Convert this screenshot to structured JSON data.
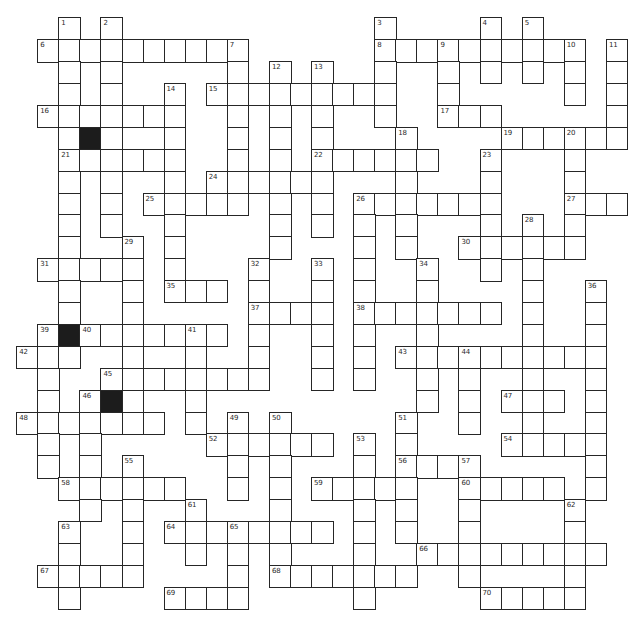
{
  "puzzle": {
    "type": "crossword",
    "columns": 29,
    "rows_count": 27,
    "legend": {
      "W": "white-cell",
      "#": "black-cell",
      ".": "empty"
    },
    "colors": {
      "line": "#262626",
      "black_cell": "#1c1c1c",
      "background": "#ffffff"
    }
  },
  "grid": {
    "rows": [
      "..W.W............W....W.W....",
      ".WWWWWWWWWW......WWWWWWWWWW.W",
      "..W.W.....W.W.W..W..W.W.W.W.W",
      "..W.W..W.WWWWWWWWW..W.....W.W",
      ".WWWWWWW..W.W.W..W..WWW.....W",
      "..W#W..W..W.W.W...W....WWWWWW",
      "..WWWWWW..W.W.WWWWWW..W...W..",
      "..W.W..W.WWWWWW...W...W...W..",
      "..W.W.WWWWW.W.W.WWWWWWW...WWW",
      "..W.W..W....W.W.W.W...W.W.W..",
      "..W..W.W....W...W.W..WWWWWW..",
      ".WWWWW.W...W..W.W..W..W.W....",
      "..W..W.WWW.W..W.W..W....W..W.",
      "..W..W.....WWWW.WWWWWWW.W..W.",
      ".W#WWWWWWW.W..W.W..W....W..W.",
      "WWW..W..W..W..W.W.WWWWWWWWWW.",
      ".W..WWWWWWWW..W.W..W.W..W..W.",
      ".W.W#W..W..........W.W.WWW.W.",
      "WWWWWWW.W.W.W.....W..W..W..W.",
      ".W.W.....WWWWWW.W.W....WWWWW.",
      ".W.W.W....W.W...W.WWWW.....W.",
      "..WWWWWW..W.W.WWWWW..WWWWW.W.",
      "...W.W..W...W...W.W..W....W..",
      "..W..W.WWWWWWWW.W.W..W....W..",
      "..W..W..W.W.W...W..WWWWWWWWW.",
      ".WWWWW....W.WWWWWWW..W....W..",
      "..W....WWWW.....W.....WWWWW.."
    ],
    "numbers": [
      {
        "n": "1",
        "c": 2,
        "r": 0
      },
      {
        "n": "2",
        "c": 4,
        "r": 0
      },
      {
        "n": "3",
        "c": 17,
        "r": 0
      },
      {
        "n": "4",
        "c": 22,
        "r": 0
      },
      {
        "n": "5",
        "c": 24,
        "r": 0
      },
      {
        "n": "6",
        "c": 1,
        "r": 1
      },
      {
        "n": "7",
        "c": 10,
        "r": 1
      },
      {
        "n": "8",
        "c": 17,
        "r": 1
      },
      {
        "n": "9",
        "c": 20,
        "r": 1
      },
      {
        "n": "10",
        "c": 26,
        "r": 1
      },
      {
        "n": "11",
        "c": 28,
        "r": 1
      },
      {
        "n": "12",
        "c": 12,
        "r": 2
      },
      {
        "n": "13",
        "c": 14,
        "r": 2
      },
      {
        "n": "14",
        "c": 7,
        "r": 3
      },
      {
        "n": "15",
        "c": 9,
        "r": 3
      },
      {
        "n": "16",
        "c": 1,
        "r": 4
      },
      {
        "n": "17",
        "c": 20,
        "r": 4
      },
      {
        "n": "18",
        "c": 18,
        "r": 5
      },
      {
        "n": "19",
        "c": 23,
        "r": 5
      },
      {
        "n": "20",
        "c": 26,
        "r": 5
      },
      {
        "n": "21",
        "c": 2,
        "r": 6
      },
      {
        "n": "22",
        "c": 14,
        "r": 6
      },
      {
        "n": "23",
        "c": 22,
        "r": 6
      },
      {
        "n": "24",
        "c": 9,
        "r": 7
      },
      {
        "n": "25",
        "c": 6,
        "r": 8
      },
      {
        "n": "26",
        "c": 16,
        "r": 8
      },
      {
        "n": "27",
        "c": 26,
        "r": 8
      },
      {
        "n": "28",
        "c": 24,
        "r": 9
      },
      {
        "n": "29",
        "c": 5,
        "r": 10
      },
      {
        "n": "30",
        "c": 21,
        "r": 10
      },
      {
        "n": "31",
        "c": 1,
        "r": 11
      },
      {
        "n": "32",
        "c": 11,
        "r": 11
      },
      {
        "n": "33",
        "c": 14,
        "r": 11
      },
      {
        "n": "34",
        "c": 19,
        "r": 11
      },
      {
        "n": "35",
        "c": 7,
        "r": 12
      },
      {
        "n": "36",
        "c": 27,
        "r": 12
      },
      {
        "n": "37",
        "c": 11,
        "r": 13
      },
      {
        "n": "38",
        "c": 16,
        "r": 13
      },
      {
        "n": "39",
        "c": 1,
        "r": 14
      },
      {
        "n": "40",
        "c": 3,
        "r": 14
      },
      {
        "n": "41",
        "c": 8,
        "r": 14
      },
      {
        "n": "42",
        "c": 0,
        "r": 15
      },
      {
        "n": "43",
        "c": 18,
        "r": 15
      },
      {
        "n": "44",
        "c": 21,
        "r": 15
      },
      {
        "n": "45",
        "c": 4,
        "r": 16
      },
      {
        "n": "46",
        "c": 3,
        "r": 17
      },
      {
        "n": "47",
        "c": 23,
        "r": 17
      },
      {
        "n": "48",
        "c": 0,
        "r": 18
      },
      {
        "n": "49",
        "c": 10,
        "r": 18
      },
      {
        "n": "50",
        "c": 12,
        "r": 18
      },
      {
        "n": "51",
        "c": 18,
        "r": 18
      },
      {
        "n": "52",
        "c": 9,
        "r": 19
      },
      {
        "n": "53",
        "c": 16,
        "r": 19
      },
      {
        "n": "54",
        "c": 23,
        "r": 19
      },
      {
        "n": "55",
        "c": 5,
        "r": 20
      },
      {
        "n": "56",
        "c": 18,
        "r": 20
      },
      {
        "n": "57",
        "c": 21,
        "r": 20
      },
      {
        "n": "58",
        "c": 2,
        "r": 21
      },
      {
        "n": "59",
        "c": 14,
        "r": 21
      },
      {
        "n": "60",
        "c": 21,
        "r": 21
      },
      {
        "n": "61",
        "c": 8,
        "r": 22
      },
      {
        "n": "62",
        "c": 26,
        "r": 22
      },
      {
        "n": "63",
        "c": 2,
        "r": 23
      },
      {
        "n": "64",
        "c": 7,
        "r": 23
      },
      {
        "n": "65",
        "c": 10,
        "r": 23
      },
      {
        "n": "66",
        "c": 19,
        "r": 24
      },
      {
        "n": "67",
        "c": 1,
        "r": 25
      },
      {
        "n": "68",
        "c": 12,
        "r": 25
      },
      {
        "n": "69",
        "c": 7,
        "r": 26
      },
      {
        "n": "70",
        "c": 22,
        "r": 26
      }
    ]
  }
}
